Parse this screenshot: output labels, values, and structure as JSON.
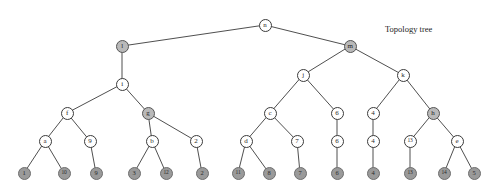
{
  "figure": {
    "title": "Topology tree",
    "title_x": 385,
    "title_y": 24,
    "width": 496,
    "height": 193,
    "background": "#ffffff",
    "edge_color": "#3b3b3b",
    "internal_node_fill": "#ffffff",
    "internal_node_shaded_fill": "#b9b9b9",
    "leaf_node_fill": "#9a9a9a",
    "node_stroke": "#3b3b3b"
  },
  "chart_data": {
    "type": "diagram",
    "diagram_type": "tree",
    "title": "Topology tree",
    "node_count": 37,
    "leaf_count": 14,
    "internal_count": 23,
    "root": "n",
    "depth_levels": 6,
    "nodes": [
      {
        "id": "n",
        "label": "n",
        "x": 265,
        "y": 25,
        "kind": "internal",
        "shaded": false,
        "level": 0
      },
      {
        "id": "l",
        "label": "l",
        "x": 122,
        "y": 46,
        "kind": "internal",
        "shaded": true,
        "level": 1
      },
      {
        "id": "m",
        "label": "m",
        "x": 350,
        "y": 46,
        "kind": "internal",
        "shaded": true,
        "level": 1
      },
      {
        "id": "i",
        "label": "i",
        "x": 122,
        "y": 84,
        "kind": "internal",
        "shaded": false,
        "level": 2
      },
      {
        "id": "j",
        "label": "j",
        "x": 303,
        "y": 75,
        "kind": "internal",
        "shaded": false,
        "level": 2
      },
      {
        "id": "k",
        "label": "k",
        "x": 403,
        "y": 75,
        "kind": "internal",
        "shaded": false,
        "level": 2
      },
      {
        "id": "f",
        "label": "f",
        "x": 67,
        "y": 113,
        "kind": "internal",
        "shaded": false,
        "level": 3
      },
      {
        "id": "g",
        "label": "g",
        "x": 148,
        "y": 113,
        "kind": "internal",
        "shaded": true,
        "level": 3
      },
      {
        "id": "c1",
        "label": "c",
        "x": 270,
        "y": 113,
        "kind": "internal",
        "shaded": false,
        "level": 3
      },
      {
        "id": "six_hi",
        "label": "6",
        "x": 337,
        "y": 113,
        "kind": "internal",
        "shaded": false,
        "level": 3
      },
      {
        "id": "four_hi",
        "label": "4",
        "x": 373,
        "y": 113,
        "kind": "internal",
        "shaded": false,
        "level": 3
      },
      {
        "id": "h",
        "label": "h",
        "x": 433,
        "y": 113,
        "kind": "internal",
        "shaded": true,
        "level": 3
      },
      {
        "id": "a",
        "label": "a",
        "x": 45,
        "y": 141,
        "kind": "internal",
        "shaded": false,
        "level": 4
      },
      {
        "id": "nine_m",
        "label": "9",
        "x": 90,
        "y": 141,
        "kind": "internal",
        "shaded": false,
        "level": 4
      },
      {
        "id": "b",
        "label": "b",
        "x": 152,
        "y": 141,
        "kind": "internal",
        "shaded": false,
        "level": 4
      },
      {
        "id": "two_m",
        "label": "2",
        "x": 196,
        "y": 141,
        "kind": "internal",
        "shaded": false,
        "level": 4
      },
      {
        "id": "d",
        "label": "d",
        "x": 246,
        "y": 141,
        "kind": "internal",
        "shaded": false,
        "level": 4
      },
      {
        "id": "seven_m",
        "label": "7",
        "x": 297,
        "y": 141,
        "kind": "internal",
        "shaded": false,
        "level": 4
      },
      {
        "id": "six_m",
        "label": "6",
        "x": 337,
        "y": 141,
        "kind": "internal",
        "shaded": false,
        "level": 4
      },
      {
        "id": "four_m",
        "label": "4",
        "x": 373,
        "y": 141,
        "kind": "internal",
        "shaded": false,
        "level": 4
      },
      {
        "id": "thir_m",
        "label": "13",
        "x": 410,
        "y": 141,
        "kind": "internal",
        "shaded": false,
        "level": 4
      },
      {
        "id": "e",
        "label": "e",
        "x": 457,
        "y": 141,
        "kind": "internal",
        "shaded": false,
        "level": 4
      },
      {
        "id": "L1",
        "label": "1",
        "x": 24,
        "y": 173,
        "kind": "leaf",
        "shaded": false,
        "level": 5
      },
      {
        "id": "L10",
        "label": "10",
        "x": 64,
        "y": 173,
        "kind": "leaf",
        "shaded": false,
        "level": 5
      },
      {
        "id": "L9",
        "label": "9",
        "x": 96,
        "y": 173,
        "kind": "leaf",
        "shaded": false,
        "level": 5
      },
      {
        "id": "L3",
        "label": "3",
        "x": 134,
        "y": 173,
        "kind": "leaf",
        "shaded": false,
        "level": 5
      },
      {
        "id": "L12",
        "label": "12",
        "x": 166,
        "y": 173,
        "kind": "leaf",
        "shaded": false,
        "level": 5
      },
      {
        "id": "L2",
        "label": "2",
        "x": 202,
        "y": 173,
        "kind": "leaf",
        "shaded": false,
        "level": 5
      },
      {
        "id": "L11",
        "label": "11",
        "x": 238,
        "y": 173,
        "kind": "leaf",
        "shaded": false,
        "level": 5
      },
      {
        "id": "L8",
        "label": "8",
        "x": 269,
        "y": 173,
        "kind": "leaf",
        "shaded": false,
        "level": 5
      },
      {
        "id": "L7",
        "label": "7",
        "x": 300,
        "y": 173,
        "kind": "leaf",
        "shaded": false,
        "level": 5
      },
      {
        "id": "L6",
        "label": "6",
        "x": 337,
        "y": 173,
        "kind": "leaf",
        "shaded": false,
        "level": 5
      },
      {
        "id": "L4",
        "label": "4",
        "x": 373,
        "y": 173,
        "kind": "leaf",
        "shaded": false,
        "level": 5
      },
      {
        "id": "L13",
        "label": "13",
        "x": 410,
        "y": 173,
        "kind": "leaf",
        "shaded": false,
        "level": 5
      },
      {
        "id": "L14",
        "label": "14",
        "x": 444,
        "y": 173,
        "kind": "leaf",
        "shaded": false,
        "level": 5
      },
      {
        "id": "L5",
        "label": "5",
        "x": 474,
        "y": 173,
        "kind": "leaf",
        "shaded": false,
        "level": 5
      }
    ],
    "edges": [
      {
        "from": "n",
        "to": "l"
      },
      {
        "from": "n",
        "to": "m"
      },
      {
        "from": "l",
        "to": "i"
      },
      {
        "from": "i",
        "to": "f"
      },
      {
        "from": "i",
        "to": "g"
      },
      {
        "from": "f",
        "to": "a"
      },
      {
        "from": "f",
        "to": "nine_m"
      },
      {
        "from": "a",
        "to": "L1"
      },
      {
        "from": "a",
        "to": "L10"
      },
      {
        "from": "nine_m",
        "to": "L9"
      },
      {
        "from": "g",
        "to": "b"
      },
      {
        "from": "g",
        "to": "two_m"
      },
      {
        "from": "b",
        "to": "L3"
      },
      {
        "from": "b",
        "to": "L12"
      },
      {
        "from": "two_m",
        "to": "L2"
      },
      {
        "from": "m",
        "to": "j"
      },
      {
        "from": "m",
        "to": "k"
      },
      {
        "from": "j",
        "to": "c1"
      },
      {
        "from": "j",
        "to": "six_hi"
      },
      {
        "from": "c1",
        "to": "d"
      },
      {
        "from": "c1",
        "to": "seven_m"
      },
      {
        "from": "d",
        "to": "L11"
      },
      {
        "from": "d",
        "to": "L8"
      },
      {
        "from": "seven_m",
        "to": "L7"
      },
      {
        "from": "six_hi",
        "to": "six_m"
      },
      {
        "from": "six_m",
        "to": "L6"
      },
      {
        "from": "k",
        "to": "four_hi"
      },
      {
        "from": "k",
        "to": "h"
      },
      {
        "from": "four_hi",
        "to": "four_m"
      },
      {
        "from": "four_m",
        "to": "L4"
      },
      {
        "from": "h",
        "to": "thir_m"
      },
      {
        "from": "h",
        "to": "e"
      },
      {
        "from": "thir_m",
        "to": "L13"
      },
      {
        "from": "e",
        "to": "L14"
      },
      {
        "from": "e",
        "to": "L5"
      }
    ]
  }
}
